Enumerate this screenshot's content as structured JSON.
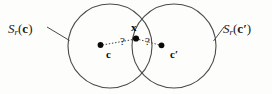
{
  "figure": {
    "name": "two-overlapping-spheres-diagram",
    "background_color": "#fdfdfb",
    "stroke_color": "#4a4a4a",
    "dot_color": "#0a0a0a",
    "labels": {
      "sphere_left": {
        "symbol": "S",
        "subscript": "r",
        "open_paren": "(",
        "argument": "c",
        "close_paren": ")",
        "full": "S_r(c)"
      },
      "sphere_right": {
        "symbol": "S",
        "subscript": "r",
        "open_paren": "(",
        "argument": "c′",
        "close_paren": ")",
        "full": "S_r(c′)"
      },
      "center_left": "c",
      "center_right": "c′",
      "intersection_point": "x",
      "question_left": "?",
      "question_right": "?"
    },
    "geometry": {
      "left_circle": {
        "cx": 110,
        "cy": 46,
        "r": 42
      },
      "right_circle": {
        "cx": 174,
        "cy": 46,
        "r": 42
      },
      "intersection_dot": {
        "x": 136,
        "y": 40
      },
      "left_center_dot": {
        "x": 100,
        "y": 46
      },
      "right_center_dot": {
        "x": 162,
        "y": 46
      },
      "leader_left": {
        "x1": 48,
        "y1": 28,
        "x2": 64,
        "y2": 40
      },
      "leader_right": {
        "x1": 222,
        "y1": 28,
        "x2": 205,
        "y2": 40
      }
    }
  }
}
